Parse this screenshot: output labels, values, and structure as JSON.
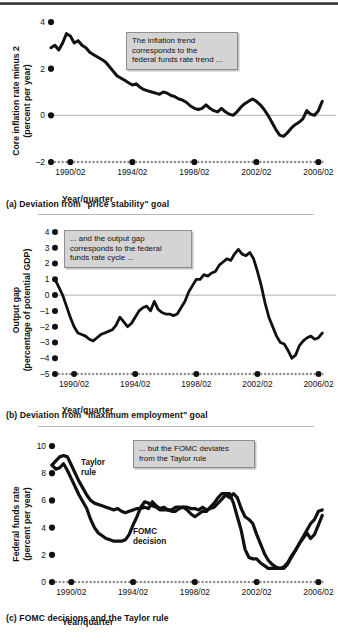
{
  "figure": {
    "xaxis_label": "Year/quarter",
    "xticks_major": [
      "1990/02",
      "1994/02",
      "1998/02",
      "2002/02",
      "2006/02"
    ],
    "colors": {
      "line": "#111111",
      "zero_line": "#a8a8a8",
      "callout_fill": "#d4d4d4",
      "callout_border": "#8e8e8e",
      "tick_dot": "#111111",
      "tick_dot_minor": "#8c8c8c",
      "rule": "#b9b9b9"
    }
  },
  "panels": [
    {
      "id": "panel-a",
      "caption": "(a) Deviation from \"price stability\" goal",
      "ytitle_line1": "Core inflation rate minus 2",
      "ytitle_line2": "(percent per year)",
      "yticks": [
        -2,
        0,
        2,
        4
      ],
      "ylim": [
        -2,
        4
      ],
      "zero_value": 0,
      "callout": {
        "lines": [
          "The inflation trend",
          "corresponds to the",
          "federal funds rate trend ..."
        ]
      },
      "chart_data": {
        "type": "line",
        "title": "Deviation from \"price stability\" goal",
        "xlabel": "Year/quarter",
        "ylabel": "Core inflation rate minus 2 (percent per year)",
        "ylim": [
          -2,
          4
        ],
        "xlim": [
          1989.0,
          2007.0
        ],
        "grid": false,
        "legend": "none",
        "series": [
          {
            "name": "Core inflation rate minus 2",
            "x": [
              1989.0,
              1989.25,
              1989.5,
              1989.75,
              1990.0,
              1990.25,
              1990.5,
              1990.75,
              1991.0,
              1991.25,
              1991.5,
              1991.75,
              1992.0,
              1992.25,
              1992.5,
              1992.75,
              1993.0,
              1993.25,
              1993.5,
              1993.75,
              1994.0,
              1994.25,
              1994.5,
              1994.75,
              1995.0,
              1995.25,
              1995.5,
              1995.75,
              1996.0,
              1996.25,
              1996.5,
              1996.75,
              1997.0,
              1997.25,
              1997.5,
              1997.75,
              1998.0,
              1998.25,
              1998.5,
              1998.75,
              1999.0,
              1999.25,
              1999.5,
              1999.75,
              2000.0,
              2000.25,
              2000.5,
              2000.75,
              2001.0,
              2001.25,
              2001.5,
              2001.75,
              2002.0,
              2002.25,
              2002.5,
              2002.75,
              2003.0,
              2003.25,
              2003.5,
              2003.75,
              2004.0,
              2004.25,
              2004.5,
              2004.75,
              2005.0,
              2005.25,
              2005.5,
              2005.75,
              2006.0,
              2006.25,
              2006.5
            ],
            "y": [
              2.9,
              3.0,
              2.8,
              3.1,
              3.5,
              3.4,
              3.1,
              3.2,
              3.0,
              2.9,
              2.7,
              2.6,
              2.5,
              2.4,
              2.3,
              2.1,
              1.9,
              1.7,
              1.6,
              1.5,
              1.4,
              1.3,
              1.35,
              1.2,
              1.1,
              1.05,
              1.0,
              0.95,
              0.9,
              1.0,
              0.95,
              0.85,
              0.8,
              0.7,
              0.65,
              0.55,
              0.4,
              0.3,
              0.25,
              0.3,
              0.45,
              0.3,
              0.2,
              0.15,
              0.3,
              0.15,
              0.05,
              0.0,
              0.15,
              0.35,
              0.5,
              0.6,
              0.7,
              0.6,
              0.45,
              0.25,
              0.0,
              -0.3,
              -0.6,
              -0.85,
              -0.9,
              -0.75,
              -0.55,
              -0.4,
              -0.3,
              -0.15,
              0.2,
              0.05,
              0.0,
              0.2,
              0.6
            ]
          }
        ]
      }
    },
    {
      "id": "panel-b",
      "caption": "(b) Deviation from \"maximum employment\" goal",
      "ytitle_line1": "Output gap",
      "ytitle_line2": "(percentage of potential GDP)",
      "yticks": [
        -5,
        -4,
        -3,
        -2,
        -1,
        0,
        1,
        2,
        3,
        4
      ],
      "ylim": [
        -5,
        4
      ],
      "zero_value": 0,
      "callout": {
        "lines": [
          "... and the output gap",
          "corresponds to the federal",
          "funds rate cycle ..."
        ]
      },
      "chart_data": {
        "type": "line",
        "title": "Deviation from \"maximum employment\" goal",
        "xlabel": "Year/quarter",
        "ylabel": "Output gap (percentage of potential GDP)",
        "ylim": [
          -5,
          4
        ],
        "xlim": [
          1989.0,
          2007.0
        ],
        "grid": false,
        "legend": "none",
        "series": [
          {
            "name": "Output gap",
            "x": [
              1989.0,
              1989.25,
              1989.5,
              1989.75,
              1990.0,
              1990.25,
              1990.5,
              1990.75,
              1991.0,
              1991.25,
              1991.5,
              1991.75,
              1992.0,
              1992.25,
              1992.5,
              1992.75,
              1993.0,
              1993.25,
              1993.5,
              1993.75,
              1994.0,
              1994.25,
              1994.5,
              1994.75,
              1995.0,
              1995.25,
              1995.5,
              1995.75,
              1996.0,
              1996.25,
              1996.5,
              1996.75,
              1997.0,
              1997.25,
              1997.5,
              1997.75,
              1998.0,
              1998.25,
              1998.5,
              1998.75,
              1999.0,
              1999.25,
              1999.5,
              1999.75,
              2000.0,
              2000.25,
              2000.5,
              2000.75,
              2001.0,
              2001.25,
              2001.5,
              2001.75,
              2002.0,
              2002.25,
              2002.5,
              2002.75,
              2003.0,
              2003.25,
              2003.5,
              2003.75,
              2004.0,
              2004.25,
              2004.5,
              2004.75,
              2005.0,
              2005.25,
              2005.5,
              2005.75,
              2006.0,
              2006.25,
              2006.5
            ],
            "y": [
              1.0,
              0.5,
              0.0,
              -0.7,
              -1.4,
              -2.0,
              -2.4,
              -2.5,
              -2.6,
              -2.8,
              -2.9,
              -2.7,
              -2.5,
              -2.4,
              -2.3,
              -2.2,
              -1.9,
              -1.4,
              -1.7,
              -2.0,
              -1.8,
              -1.4,
              -1.0,
              -0.8,
              -0.7,
              -1.0,
              -0.4,
              -0.9,
              -1.1,
              -1.2,
              -1.2,
              -1.3,
              -1.2,
              -0.8,
              -0.4,
              0.2,
              0.6,
              1.0,
              1.0,
              1.3,
              1.2,
              1.4,
              1.5,
              1.9,
              2.1,
              2.3,
              2.2,
              2.6,
              2.9,
              2.6,
              2.5,
              2.7,
              2.3,
              1.5,
              0.6,
              -0.5,
              -1.4,
              -2.0,
              -2.6,
              -3.0,
              -3.1,
              -3.5,
              -4.0,
              -3.8,
              -3.2,
              -2.9,
              -2.7,
              -2.6,
              -2.8,
              -2.7,
              -2.4
            ]
          }
        ]
      }
    },
    {
      "id": "panel-c",
      "caption": "(c) FOMC decisions and the Taylor rule",
      "ytitle_line1": "Federal funds rate",
      "ytitle_line2": "(percent per year)",
      "yticks": [
        0,
        2,
        4,
        6,
        8,
        10
      ],
      "ylim": [
        0,
        10
      ],
      "zero_value": null,
      "callout": {
        "lines": [
          "... but the FOMC deviates",
          "from the Taylor rule"
        ]
      },
      "series_labels": [
        {
          "text_line1": "Taylor",
          "text_line2": "rule"
        },
        {
          "text_line1": "FOMC",
          "text_line2": "decision"
        }
      ],
      "chart_data": {
        "type": "line",
        "title": "FOMC decisions and the Taylor rule",
        "xlabel": "Year/quarter",
        "ylabel": "Federal funds rate (percent per year)",
        "ylim": [
          0,
          10
        ],
        "xlim": [
          1989.0,
          2007.0
        ],
        "grid": false,
        "legend": "inline-labels",
        "series": [
          {
            "name": "Taylor rule",
            "x": [
              1989.0,
              1989.25,
              1989.5,
              1989.75,
              1990.0,
              1990.25,
              1990.5,
              1990.75,
              1991.0,
              1991.25,
              1991.5,
              1991.75,
              1992.0,
              1992.25,
              1992.5,
              1992.75,
              1993.0,
              1993.25,
              1993.5,
              1993.75,
              1994.0,
              1994.25,
              1994.5,
              1994.75,
              1995.0,
              1995.25,
              1995.5,
              1995.75,
              1996.0,
              1996.25,
              1996.5,
              1996.75,
              1997.0,
              1997.25,
              1997.5,
              1997.75,
              1998.0,
              1998.25,
              1998.5,
              1998.75,
              1999.0,
              1999.25,
              1999.5,
              1999.75,
              2000.0,
              2000.25,
              2000.5,
              2000.75,
              2001.0,
              2001.25,
              2001.5,
              2001.75,
              2002.0,
              2002.25,
              2002.5,
              2002.75,
              2003.0,
              2003.25,
              2003.5,
              2003.75,
              2004.0,
              2004.25,
              2004.5,
              2004.75,
              2005.0,
              2005.25,
              2005.5,
              2005.75,
              2006.0,
              2006.25,
              2006.5
            ],
            "y": [
              8.6,
              8.9,
              9.2,
              9.3,
              9.2,
              8.6,
              8.0,
              7.4,
              6.9,
              6.4,
              6.0,
              5.8,
              5.7,
              5.6,
              5.5,
              5.4,
              5.3,
              5.4,
              5.2,
              5.1,
              5.2,
              5.3,
              5.4,
              5.4,
              5.5,
              5.4,
              5.9,
              5.6,
              5.4,
              5.5,
              5.3,
              5.2,
              5.2,
              5.4,
              5.5,
              5.5,
              5.4,
              5.4,
              5.3,
              5.5,
              5.3,
              5.4,
              5.5,
              5.8,
              6.1,
              6.4,
              6.2,
              6.5,
              6.2,
              5.4,
              4.8,
              4.6,
              4.3,
              3.5,
              2.8,
              2.1,
              1.6,
              1.3,
              1.1,
              1.0,
              1.1,
              1.4,
              1.9,
              2.3,
              2.8,
              3.2,
              3.6,
              3.2,
              3.5,
              4.2,
              4.9
            ]
          },
          {
            "name": "FOMC decision",
            "x": [
              1989.0,
              1989.25,
              1989.5,
              1989.75,
              1990.0,
              1990.25,
              1990.5,
              1990.75,
              1991.0,
              1991.25,
              1991.5,
              1991.75,
              1992.0,
              1992.25,
              1992.5,
              1992.75,
              1993.0,
              1993.25,
              1993.5,
              1993.75,
              1994.0,
              1994.25,
              1994.5,
              1994.75,
              1995.0,
              1995.25,
              1995.5,
              1995.75,
              1996.0,
              1996.25,
              1996.5,
              1996.75,
              1997.0,
              1997.25,
              1997.5,
              1997.75,
              1998.0,
              1998.25,
              1998.5,
              1998.75,
              1999.0,
              1999.25,
              1999.5,
              1999.75,
              2000.0,
              2000.25,
              2000.5,
              2000.75,
              2001.0,
              2001.25,
              2001.5,
              2001.75,
              2002.0,
              2002.25,
              2002.5,
              2002.75,
              2003.0,
              2003.25,
              2003.5,
              2003.75,
              2004.0,
              2004.25,
              2004.5,
              2004.75,
              2005.0,
              2005.25,
              2005.5,
              2005.75,
              2006.0,
              2006.25,
              2006.5
            ],
            "y": [
              8.6,
              8.3,
              8.4,
              8.7,
              8.2,
              7.6,
              7.0,
              6.4,
              5.9,
              5.4,
              4.6,
              4.0,
              3.6,
              3.4,
              3.2,
              3.1,
              3.0,
              3.0,
              3.0,
              3.1,
              3.5,
              4.2,
              4.8,
              5.5,
              5.9,
              5.8,
              5.6,
              5.5,
              5.3,
              5.3,
              5.3,
              5.3,
              5.5,
              5.5,
              5.5,
              5.3,
              5.0,
              4.8,
              5.0,
              5.2,
              5.2,
              5.5,
              5.8,
              6.2,
              6.5,
              6.5,
              6.5,
              5.8,
              4.8,
              3.8,
              2.4,
              1.8,
              1.7,
              1.7,
              1.4,
              1.2,
              1.0,
              1.0,
              1.0,
              1.0,
              1.0,
              1.3,
              1.8,
              2.3,
              2.8,
              3.3,
              3.8,
              4.3,
              4.6,
              5.2,
              5.3
            ]
          }
        ]
      }
    }
  ]
}
